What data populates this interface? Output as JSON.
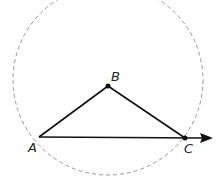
{
  "diagram": {
    "circle": {
      "cx": 108,
      "cy": 80,
      "r": 95,
      "stroke": "#999999",
      "dash": "4,3"
    },
    "points": [
      {
        "label": "A",
        "x": 39,
        "y": 137,
        "lx": 28,
        "ly": 152
      },
      {
        "label": "B",
        "x": 108,
        "y": 86,
        "lx": 111,
        "ly": 81
      },
      {
        "label": "C",
        "x": 185,
        "y": 138,
        "lx": 184,
        "ly": 153
      }
    ],
    "arrow": {
      "from": "A",
      "to_x": 212,
      "to_y": 138
    },
    "stroke_color": "#111111"
  }
}
